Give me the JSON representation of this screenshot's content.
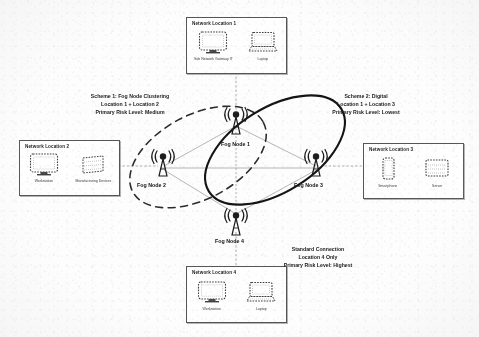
{
  "diagram": {
    "locations": [
      {
        "id": "loc1",
        "title": "Network Location 1",
        "devices": [
          {
            "name": "workstation",
            "caption": "Sub Network Gateway IT",
            "icon": "monitor-icon"
          },
          {
            "name": "laptop",
            "caption": "Laptop",
            "icon": "laptop-icon"
          }
        ]
      },
      {
        "id": "loc2",
        "title": "Network Location 2",
        "devices": [
          {
            "name": "workstation",
            "caption": "Workstation",
            "icon": "monitor-icon"
          },
          {
            "name": "server",
            "caption": "Manufacturing Devices",
            "icon": "server-icon"
          }
        ]
      },
      {
        "id": "loc3",
        "title": "Network Location 3",
        "devices": [
          {
            "name": "mobile",
            "caption": "Smartphone",
            "icon": "phone-icon"
          },
          {
            "name": "server",
            "caption": "Server",
            "icon": "server-icon"
          }
        ]
      },
      {
        "id": "loc4",
        "title": "Network Location 4",
        "devices": [
          {
            "name": "workstation",
            "caption": "Workstation",
            "icon": "monitor-icon"
          },
          {
            "name": "laptop",
            "caption": "Laptop",
            "icon": "laptop-icon"
          }
        ]
      }
    ],
    "fog_nodes": [
      {
        "id": "fn1",
        "label": "Fog Node 1"
      },
      {
        "id": "fn2",
        "label": "Fog Node 2"
      },
      {
        "id": "fn3",
        "label": "Fog Node 3"
      },
      {
        "id": "fn4",
        "label": "Fog Node 4"
      }
    ],
    "annotations": [
      {
        "id": "scheme1",
        "line1": "Scheme 1: Fog Node Clustering",
        "line2": "Location 1 + Location 2",
        "line3": "Primary Risk Level: Medium"
      },
      {
        "id": "scheme2",
        "line1": "Scheme 2: Digital",
        "line2": "Location 1 + Location 3",
        "line3": "Primary Risk Level: Lowest"
      },
      {
        "id": "standard",
        "line1": "Standard Connection",
        "line2": "Location 4 Only",
        "line3": "Primary Risk Level: Highest"
      }
    ],
    "groupings": [
      {
        "id": "cluster-dashed",
        "style": "dashed",
        "members": [
          "Fog Node 1",
          "Fog Node 2"
        ]
      },
      {
        "id": "cluster-solid",
        "style": "solid",
        "members": [
          "Fog Node 1",
          "Fog Node 3"
        ]
      }
    ],
    "colors": {
      "ink": "#1a1a1a",
      "line": "#7a7a7a",
      "box_border": "#555555",
      "paper": "#fdfdfd"
    }
  }
}
